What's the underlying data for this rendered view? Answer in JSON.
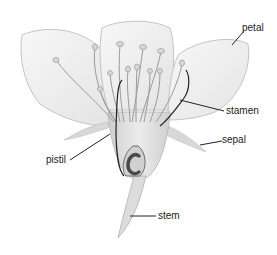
{
  "diagram": {
    "colors": {
      "petal_fill": "#f1f1f1",
      "petal_stroke": "#bdbdbd",
      "stamen": "#9a9a9a",
      "ovary": "#5a5a5a",
      "leader_line": "#222222",
      "text": "#222222"
    },
    "labels": [
      {
        "id": "petal",
        "text": "petal",
        "x": 242,
        "y": 23
      },
      {
        "id": "stamen",
        "text": "stamen",
        "x": 226,
        "y": 107
      },
      {
        "id": "sepal",
        "text": "sepal",
        "x": 222,
        "y": 135
      },
      {
        "id": "pistil",
        "text": "pistil",
        "x": 46,
        "y": 156
      },
      {
        "id": "stem",
        "text": "stem",
        "x": 158,
        "y": 211
      }
    ]
  }
}
